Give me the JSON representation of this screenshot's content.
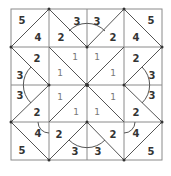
{
  "diagram": {
    "title": "",
    "type": "quilt-block-pattern",
    "grid": {
      "rows": 4,
      "cols": 4
    },
    "labels": {
      "corner_tl_outer": "5",
      "corner_tl_inner": "4",
      "top_left_2": "2",
      "top_3_left": "3",
      "top_3_right": "3",
      "top_right_2": "2",
      "corner_tr_inner": "4",
      "corner_tr_outer": "5",
      "left_2_top": "2",
      "left_3_top": "3",
      "left_3_bottom": "3",
      "left_2_bottom": "2",
      "right_2_top": "2",
      "right_3_top": "3",
      "right_3_bottom": "3",
      "right_2_bottom": "2",
      "center_1_a": "1",
      "center_1_b": "1",
      "center_1_c": "1",
      "center_1_d": "1",
      "center_1_e": "1",
      "center_1_f": "1",
      "center_1_g": "1",
      "center_1_h": "1",
      "corner_bl_inner": "4",
      "corner_bl_outer": "5",
      "bottom_left_2": "2",
      "bottom_3_left": "3",
      "bottom_3_right": "3",
      "bottom_right_2": "2",
      "corner_br_inner": "4",
      "corner_br_outer": "5"
    },
    "colors": {
      "grid": "#8a8a8a",
      "line": "#555555",
      "text": "#333333"
    }
  }
}
